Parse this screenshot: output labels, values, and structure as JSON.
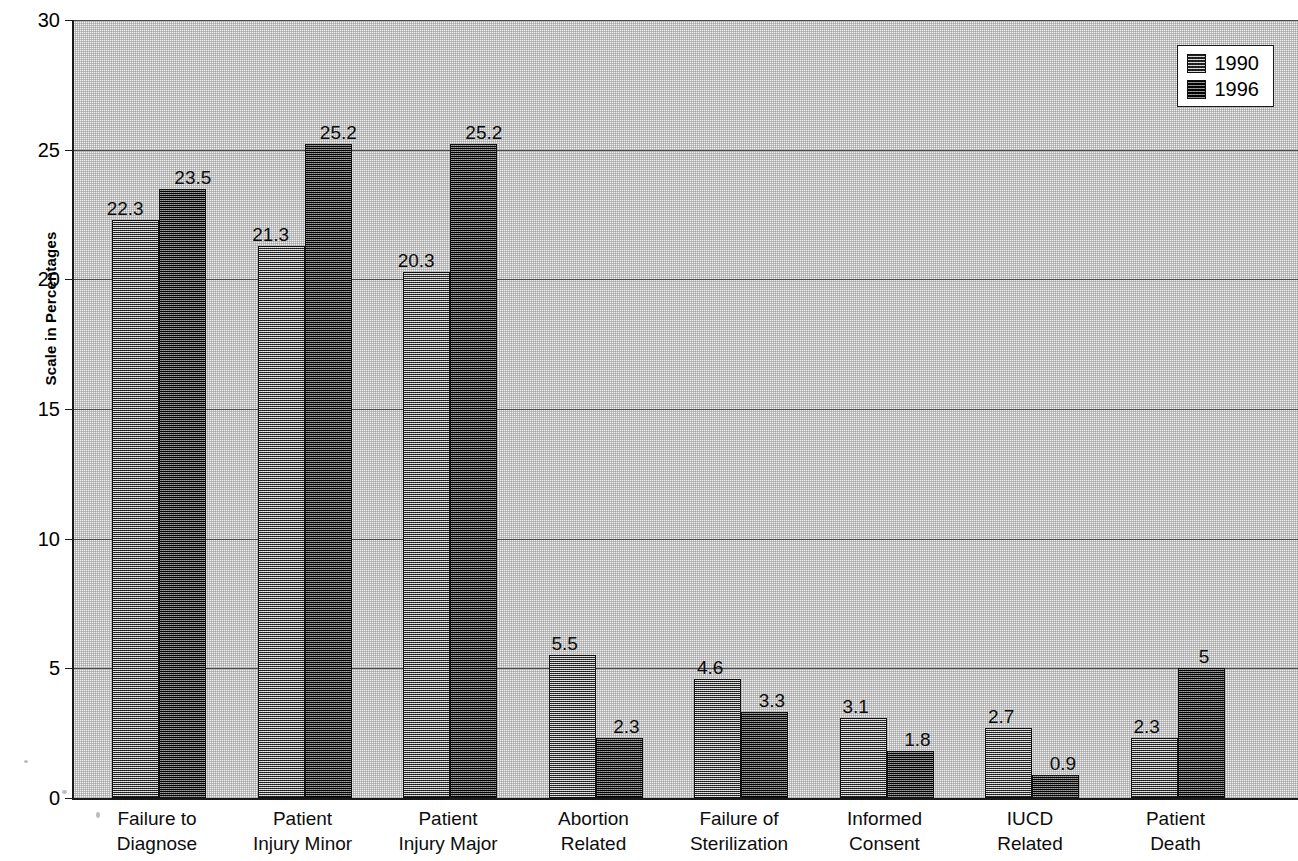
{
  "chart_data": {
    "type": "bar",
    "title": "",
    "subtitle": "",
    "xlabel": "",
    "ylabel": "Scale in Percentages",
    "ylim": [
      0,
      30
    ],
    "ytick_values": [
      0,
      5,
      10,
      15,
      20,
      25,
      30
    ],
    "ytick_labels": [
      "0",
      "5",
      "10",
      "15",
      "20",
      "25",
      "30"
    ],
    "grid": true,
    "grid_axis": "y",
    "legend_position": "top-right",
    "categories": [
      "Failure to Diagnose",
      "Patient Injury Minor",
      "Patient Injury Major",
      "Abortion Related",
      "Failure of Sterilization",
      "Informed Consent",
      "IUCD Related",
      "Patient Death"
    ],
    "category_lines": [
      [
        "Failure to",
        "Diagnose"
      ],
      [
        "Patient",
        "Injury Minor"
      ],
      [
        "Patient",
        "Injury Major"
      ],
      [
        "Abortion",
        "Related"
      ],
      [
        "Failure of",
        "Sterilization"
      ],
      [
        "Informed",
        "Consent"
      ],
      [
        "IUCD",
        "Related"
      ],
      [
        "Patient",
        "Death"
      ]
    ],
    "series": [
      {
        "name": "1990",
        "values": [
          22.3,
          21.3,
          20.3,
          5.5,
          4.6,
          3.1,
          2.7,
          2.3
        ],
        "labels": [
          "22.3",
          "21.3",
          "20.3",
          "5.5",
          "4.6",
          "3.1",
          "2.7",
          "2.3"
        ]
      },
      {
        "name": "1996",
        "values": [
          23.5,
          25.2,
          25.2,
          2.3,
          3.3,
          1.8,
          0.9,
          5
        ],
        "labels": [
          "23.5",
          "25.2",
          "25.2",
          "2.3",
          "3.3",
          "1.8",
          "0.9",
          "5"
        ]
      }
    ]
  },
  "legend": {
    "entries": [
      {
        "label": "1990"
      },
      {
        "label": "1996"
      }
    ]
  },
  "colors": {
    "series_1990": "#8a8a8a",
    "series_1996": "#3a3a3a",
    "plot_background": "#f2f2f2",
    "axis": "#1a1a1a",
    "gridline": "#4a4a4a",
    "text": "#000000"
  }
}
